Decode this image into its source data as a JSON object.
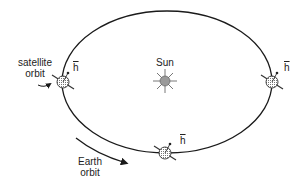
{
  "diagram": {
    "orbit": {
      "cx": 167,
      "cy": 82,
      "rx": 105,
      "ry": 71,
      "stroke": "#1a1a1a"
    },
    "sun": {
      "label": "Sun",
      "cx": 165,
      "cy": 81,
      "fill": "#9a9a9a"
    },
    "labels": {
      "satellite_orbit_line1": "satellite",
      "satellite_orbit_line2": "orbit",
      "earth_orbit_line1": "Earth",
      "earth_orbit_line2": "orbit",
      "angular_momentum": "h"
    },
    "earth_positions": [
      {
        "name": "left",
        "cx": 63,
        "cy": 82
      },
      {
        "name": "right",
        "cx": 272,
        "cy": 82
      },
      {
        "name": "bottom",
        "cx": 165,
        "cy": 153
      }
    ]
  }
}
